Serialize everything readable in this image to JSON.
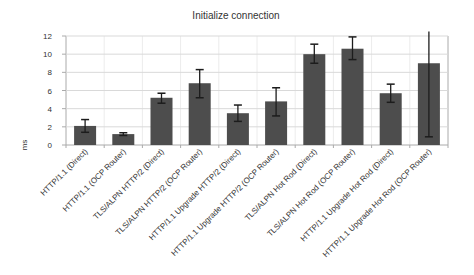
{
  "window": {
    "background": "#ffffff"
  },
  "chart_data": {
    "type": "bar",
    "title": "Initialize connection",
    "xlabel": "",
    "ylabel": "ms",
    "legend": "none",
    "grid": "horizontal major gridlines, faint vertical category gridlines",
    "ylim": [
      0,
      12
    ],
    "ytick_step": 2,
    "yticks": [
      0,
      2,
      4,
      6,
      8,
      10,
      12
    ],
    "categories": [
      "HTTP/1.1 (Direct)",
      "HTTP/1.1 (OCP Router)",
      "TLS/ALPN HTTP/2 (Direct)",
      "TLS/ALPN HTTP/2 (OCP Router)",
      "HTTP/1.1 Upgrade HTTP/2 (Direct)",
      "HTTP/1.1 Upgrade HTTP/2 (OCP Router)",
      "TLS/ALPN Hot Rod (Direct)",
      "TLS/ALPN Hot Rod (OCP Router)",
      "HTTP/1.1 Upgrade Hot Rod (Direct)",
      "HTTP/1.1 Upgrade Hot Rod (OCP Router)"
    ],
    "values": [
      2.1,
      1.2,
      5.2,
      6.8,
      3.5,
      4.8,
      10.0,
      10.6,
      5.7,
      9.0
    ],
    "error_low": [
      1.4,
      1.05,
      4.6,
      5.2,
      2.6,
      3.2,
      9.0,
      9.4,
      4.7,
      0.9
    ],
    "error_high": [
      2.8,
      1.35,
      5.7,
      8.3,
      4.4,
      6.3,
      11.1,
      11.9,
      6.7,
      12.5
    ],
    "bar_color": "#4d4d4d",
    "error_color": "#1c1c1c",
    "grid_color": "#d9d9d9",
    "faint_grid_color": "#ececec",
    "axis_color": "#aaaaaa",
    "text_color": "#333333"
  }
}
